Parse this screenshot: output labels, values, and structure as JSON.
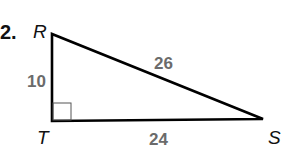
{
  "problem": {
    "number": "2."
  },
  "triangle": {
    "vertices": [
      {
        "label": "R",
        "x": 52,
        "y": 34
      },
      {
        "label": "T",
        "x": 52,
        "y": 121
      },
      {
        "label": "S",
        "x": 263,
        "y": 119
      }
    ],
    "right_angle_at": "T",
    "sides": [
      {
        "name": "RT",
        "length": "10"
      },
      {
        "name": "RS",
        "length": "26"
      },
      {
        "name": "TS",
        "length": "24"
      }
    ],
    "colors": {
      "stroke": "#000000",
      "length_labels": "#6b6b6b"
    }
  }
}
